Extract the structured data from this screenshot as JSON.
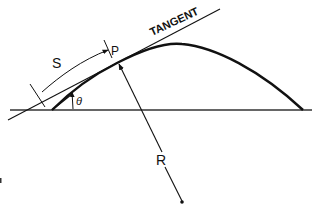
{
  "diagram": {
    "labels": {
      "tangent": "TANGENT",
      "arc_length": "S",
      "point": "P",
      "angle": "θ",
      "radius": "R"
    },
    "colors": {
      "line": "#111111",
      "baseline": "#333333",
      "background": "#ffffff"
    }
  }
}
